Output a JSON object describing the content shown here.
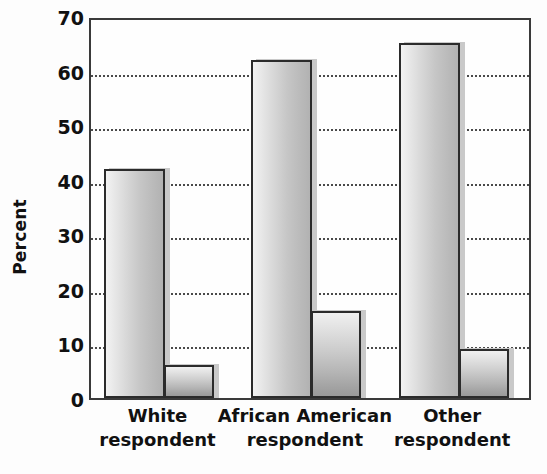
{
  "chart_data": {
    "type": "bar",
    "title": "",
    "xlabel": "",
    "ylabel": "Percent",
    "ylim": [
      0,
      70
    ],
    "ytick_step": 10,
    "yticks": [
      70,
      60,
      50,
      40,
      30,
      20,
      10,
      0
    ],
    "ytick_labels": [
      "70",
      "60",
      "50",
      "40",
      "30",
      "20",
      "10",
      "0"
    ],
    "grid": true,
    "grid_axis": "y",
    "grid_style": "dotted",
    "legend": "none",
    "categories": [
      "White respondent",
      "African American respondent",
      "Other respondent"
    ],
    "category_lines": [
      [
        "White",
        "respondent"
      ],
      [
        "African American",
        "respondent"
      ],
      [
        "Other",
        "respondent"
      ]
    ],
    "series": [
      {
        "name": "series-1",
        "values": [
          42,
          62,
          65
        ]
      },
      {
        "name": "series-2",
        "values": [
          6,
          16,
          9
        ]
      }
    ],
    "colors": {
      "series1_fill_light": "#f2f2f2",
      "series1_fill_dark": "#b2b2b2",
      "series2_fill_light": "#f0f0f0",
      "series2_fill_dark": "#9a9a9a",
      "bar_outline": "#2b2b2b",
      "axis": "#3a3a3a",
      "gridline": "#4a4a4a",
      "background": "#fdfdfd",
      "text": "#111111"
    }
  }
}
